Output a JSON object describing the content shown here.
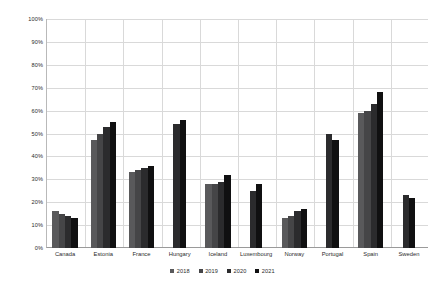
{
  "chart_data": {
    "type": "bar",
    "title": "",
    "subtitle": "",
    "xlabel": "",
    "ylabel": "",
    "ylim": [
      0,
      100
    ],
    "ytick_labels": [
      "0%",
      "10%",
      "20%",
      "30%",
      "40%",
      "50%",
      "60%",
      "70%",
      "80%",
      "90%",
      "100%"
    ],
    "ytick_values": [
      0,
      10,
      20,
      30,
      40,
      50,
      60,
      70,
      80,
      90,
      100
    ],
    "grid": "horizontal-and-vertical",
    "legend_position": "bottom-center",
    "categories": [
      "Canada",
      "Estonia",
      "France",
      "Hungary",
      "Iceland",
      "Luxembourg",
      "Norway",
      "Portugal",
      "Spain",
      "Sweden"
    ],
    "series": [
      {
        "name": "2018",
        "color": "#59595b",
        "values": [
          16,
          47,
          33,
          null,
          28,
          null,
          13,
          null,
          59,
          null
        ]
      },
      {
        "name": "2019",
        "color": "#454547",
        "values": [
          15,
          50,
          34,
          null,
          28,
          null,
          14,
          null,
          60,
          null
        ]
      },
      {
        "name": "2020",
        "color": "#2b2b2d",
        "values": [
          14,
          53,
          35,
          54,
          29,
          25,
          16,
          50,
          63,
          23
        ]
      },
      {
        "name": "2021",
        "color": "#101011",
        "values": [
          13,
          55,
          36,
          56,
          32,
          28,
          17,
          47,
          68,
          22
        ]
      }
    ]
  }
}
